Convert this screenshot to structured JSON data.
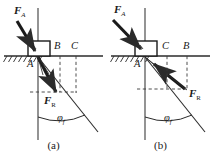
{
  "figure": {
    "accent_color": "#1a1a1a",
    "line_color": "#2b2b2b",
    "dash_color": "#3a3a3a",
    "background": "#ffffff"
  },
  "panels": [
    {
      "id": "panel-a",
      "caption": "(a)",
      "labels": {
        "force_applied": "F",
        "force_applied_sub": "A",
        "force_resultant": "F",
        "force_resultant_sub": "R",
        "point_a": "A",
        "point_b": "B",
        "point_c": "C",
        "angle": "φ",
        "angle_sub": "f"
      },
      "geometry": {
        "origin_x": 38,
        "origin_y": 56,
        "ground_y": 56,
        "vertical_x": 38,
        "point_b_x": 60,
        "point_c_x": 76,
        "fa_tail_x": 18,
        "fa_tail_y": 22,
        "fr_tip_x": 60,
        "fr_tip_y": 94,
        "cone_tip_x": 95,
        "cone_tip_y": 128,
        "arc_radius": 52,
        "angle_deg": 34
      }
    },
    {
      "id": "panel-b",
      "caption": "(b)",
      "labels": {
        "force_applied": "F",
        "force_applied_sub": "A",
        "force_resultant": "F",
        "force_resultant_sub": "R",
        "point_a": "A",
        "point_b": "B",
        "point_c": "C",
        "angle": "φ",
        "angle_sub": "f"
      },
      "geometry": {
        "origin_x": 38,
        "origin_y": 56,
        "ground_y": 56,
        "vertical_x": 38,
        "point_c_x": 60,
        "point_b_x": 80,
        "fa_tail_x": 10,
        "fa_tail_y": 18,
        "fr_tip_x": 80,
        "fr_tip_y": 92,
        "cone_tip_x": 95,
        "cone_tip_y": 128,
        "arc_radius": 52,
        "angle_deg": 34
      }
    }
  ]
}
